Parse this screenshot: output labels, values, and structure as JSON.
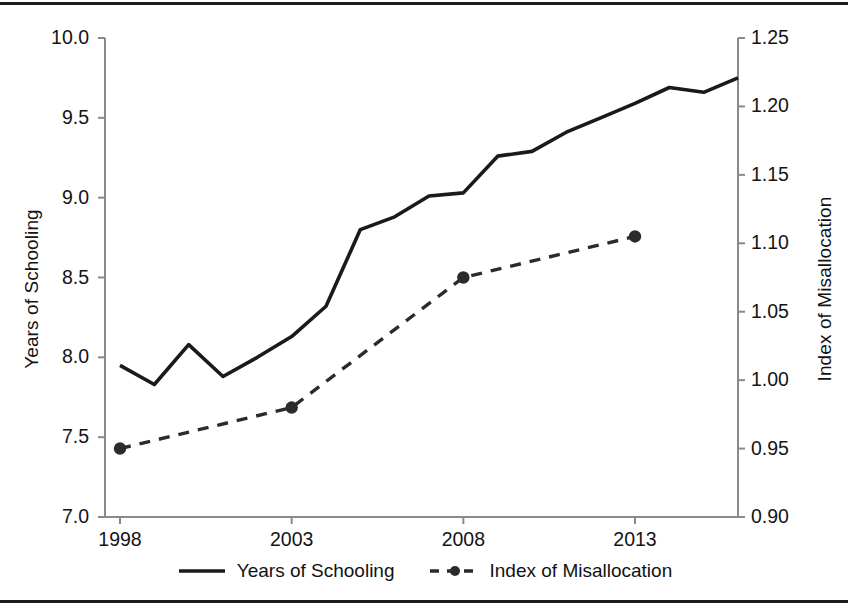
{
  "chart_data": {
    "type": "line",
    "title": "",
    "xlabel": "",
    "ylabel": "Years of Schooling",
    "ylabel_right": "Index of Misallocation",
    "grid": false,
    "legend_position": "bottom",
    "xlim": [
      1998,
      2016
    ],
    "ylim": [
      7.0,
      10.0
    ],
    "ylim_right": [
      0.9,
      1.25
    ],
    "x_ticks": [
      "1998",
      "2003",
      "2008",
      "2013"
    ],
    "x_tick_values": [
      1998,
      2003,
      2008,
      2013
    ],
    "y_ticks_left": [
      "7.0",
      "7.5",
      "8.0",
      "8.5",
      "9.0",
      "9.5",
      "10.0"
    ],
    "y_tick_values_left": [
      7.0,
      7.5,
      8.0,
      8.5,
      9.0,
      9.5,
      10.0
    ],
    "y_ticks_right": [
      "0.90",
      "0.95",
      "1.00",
      "1.05",
      "1.10",
      "1.15",
      "1.20",
      "1.25"
    ],
    "y_tick_values_right": [
      0.9,
      0.95,
      1.0,
      1.05,
      1.1,
      1.15,
      1.2,
      1.25
    ],
    "series": [
      {
        "name": "Years of Schooling",
        "axis": "left",
        "style": "solid",
        "color": "#1a1a1a",
        "markers": false,
        "x": [
          1998,
          1999,
          2000,
          2001,
          2002,
          2003,
          2004,
          2005,
          2006,
          2007,
          2008,
          2009,
          2010,
          2011,
          2012,
          2013,
          2014,
          2015,
          2016
        ],
        "values": [
          7.95,
          7.83,
          8.08,
          7.88,
          8.0,
          8.13,
          8.32,
          8.8,
          8.88,
          9.01,
          9.03,
          9.26,
          9.29,
          9.41,
          9.5,
          9.59,
          9.69,
          9.66,
          9.75
        ]
      },
      {
        "name": "Index of Misallocation",
        "axis": "right",
        "style": "dashed",
        "color": "#2b2b2b",
        "markers": true,
        "x": [
          1998,
          2003,
          2008,
          2013
        ],
        "values": [
          0.95,
          0.98,
          1.075,
          1.105
        ]
      }
    ],
    "legend": [
      "Years of Schooling",
      "Index of Misallocation"
    ]
  },
  "axes": {
    "left_title": "Years of Schooling",
    "right_title": "Index of Misallocation"
  },
  "legend": {
    "items": [
      {
        "label": "Years of Schooling"
      },
      {
        "label": "Index of Misallocation"
      }
    ]
  }
}
